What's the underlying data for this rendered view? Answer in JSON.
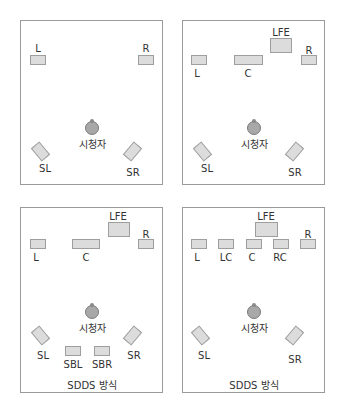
{
  "listener_label": "시청자",
  "panels": [
    {
      "id": "stereo-surround",
      "speakers": {
        "L": "L",
        "R": "R",
        "SL": "SL",
        "SR": "SR"
      },
      "caption": ""
    },
    {
      "id": "5.1",
      "speakers": {
        "LFE": "LFE",
        "L": "L",
        "C": "C",
        "R": "R",
        "SL": "SL",
        "SR": "SR"
      },
      "caption": ""
    },
    {
      "id": "sdds-7.1-back",
      "speakers": {
        "LFE": "LFE",
        "L": "L",
        "C": "C",
        "R": "R",
        "SL": "SL",
        "SR": "SR",
        "SBL": "SBL",
        "SBR": "SBR"
      },
      "caption": "SDDS 방식"
    },
    {
      "id": "sdds-7.1-front",
      "speakers": {
        "LFE": "LFE",
        "L": "L",
        "LC": "LC",
        "C": "C",
        "RC": "RC",
        "R": "R",
        "SL": "SL",
        "SR": "SR"
      },
      "caption": "SDDS 방식"
    }
  ],
  "colors": {
    "speaker_fill": "#dcdcdc",
    "speaker_border": "#9e9e9e",
    "frame": "#9a9a9a",
    "listener": "#a8a8a8"
  }
}
